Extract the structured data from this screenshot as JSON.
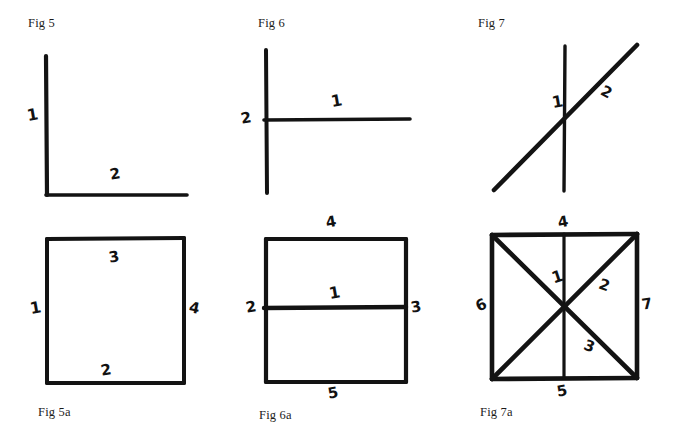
{
  "page": {
    "background": "#ffffff",
    "ink_color": "#131313",
    "width": 681,
    "height": 435
  },
  "figures": [
    {
      "id": "fig5",
      "caption": "Fig 5",
      "description": "Two line segments meeting at a right angle forming an L shape",
      "labels": [
        {
          "text": "1",
          "role": "vertical-segment"
        },
        {
          "text": "2",
          "role": "horizontal-segment"
        }
      ]
    },
    {
      "id": "fig6",
      "caption": "Fig 6",
      "description": "A vertical line met at its midpoint by a horizontal line forming a sideways T",
      "labels": [
        {
          "text": "1",
          "role": "horizontal-segment"
        },
        {
          "text": "2",
          "role": "vertical-segment"
        }
      ]
    },
    {
      "id": "fig7",
      "caption": "Fig 7",
      "description": "A vertical line crossed by a diagonal line",
      "labels": [
        {
          "text": "1",
          "role": "vertical-line"
        },
        {
          "text": "2",
          "role": "diagonal-line"
        }
      ]
    },
    {
      "id": "fig5a",
      "caption": "Fig 5a",
      "description": "A square with its four sides numbered",
      "labels": [
        {
          "text": "1",
          "role": "left-side"
        },
        {
          "text": "2",
          "role": "bottom-side"
        },
        {
          "text": "3",
          "role": "top-side"
        },
        {
          "text": "4",
          "role": "right-side"
        }
      ]
    },
    {
      "id": "fig6a",
      "caption": "Fig 6a",
      "description": "A square divided by a horizontal middle line, five segments numbered",
      "labels": [
        {
          "text": "1",
          "role": "middle-horizontal-line"
        },
        {
          "text": "2",
          "role": "left-side"
        },
        {
          "text": "3",
          "role": "right-side"
        },
        {
          "text": "4",
          "role": "top-side"
        },
        {
          "text": "5",
          "role": "bottom-side"
        }
      ]
    },
    {
      "id": "fig7a",
      "caption": "Fig 7a",
      "description": "A square with both diagonals and a vertical centre line, seven segments numbered",
      "labels": [
        {
          "text": "1",
          "role": "upper-vertical-centre"
        },
        {
          "text": "2",
          "role": "upper-right-diagonal"
        },
        {
          "text": "3",
          "role": "lower-right-diagonal"
        },
        {
          "text": "4",
          "role": "top-side"
        },
        {
          "text": "5",
          "role": "bottom-side"
        },
        {
          "text": "6",
          "role": "left-side"
        },
        {
          "text": "7",
          "role": "right-side"
        }
      ]
    }
  ]
}
